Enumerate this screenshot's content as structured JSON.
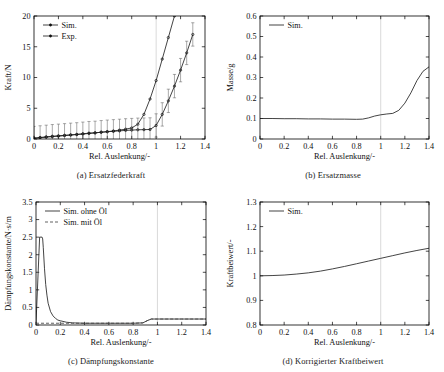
{
  "figure": {
    "panels": [
      "a",
      "b",
      "c",
      "d"
    ]
  },
  "chart_data": [
    {
      "id": "a",
      "type": "line",
      "title": "",
      "caption": "(a) Ersatzfederkraft",
      "xlabel": "Rel. Auslenkung/-",
      "ylabel": "Kraft/N",
      "xlim": [
        0,
        1.4
      ],
      "ylim": [
        0,
        20
      ],
      "xticks": [
        0,
        0.2,
        0.4,
        0.6,
        0.8,
        1,
        1.2,
        1.4
      ],
      "xticklabels": [
        "0",
        "0.2",
        "0.4",
        "0.6",
        "0.8",
        "1",
        "1.2",
        "1.4"
      ],
      "yticks": [
        0,
        5,
        10,
        15,
        20
      ],
      "yticklabels": [
        "0",
        "5",
        "10",
        "15",
        "20"
      ],
      "grid": false,
      "legend_position": "top-left",
      "reference_line_x": 1,
      "series": [
        {
          "name": "Sim.",
          "style": "solid-marker",
          "x": [
            0,
            0.05,
            0.1,
            0.15,
            0.2,
            0.25,
            0.3,
            0.35,
            0.4,
            0.45,
            0.5,
            0.55,
            0.6,
            0.65,
            0.7,
            0.75,
            0.8,
            0.85,
            0.9,
            0.95,
            1.0,
            1.05,
            1.1,
            1.15
          ],
          "y": [
            0.1,
            0.2,
            0.3,
            0.38,
            0.46,
            0.55,
            0.63,
            0.72,
            0.8,
            0.9,
            1.0,
            1.1,
            1.2,
            1.3,
            1.45,
            1.6,
            1.8,
            2.4,
            4.0,
            6.5,
            9.5,
            13.0,
            16.5,
            20.0
          ]
        },
        {
          "name": "Exp.",
          "style": "solid-marker-errorbar",
          "x": [
            0,
            0.05,
            0.1,
            0.15,
            0.2,
            0.25,
            0.3,
            0.35,
            0.4,
            0.45,
            0.5,
            0.55,
            0.6,
            0.65,
            0.7,
            0.75,
            0.8,
            0.85,
            0.9,
            0.95,
            1.0,
            1.05,
            1.1,
            1.15,
            1.2,
            1.25,
            1.3
          ],
          "y": [
            0.15,
            0.25,
            0.35,
            0.45,
            0.52,
            0.6,
            0.68,
            0.75,
            0.85,
            0.95,
            1.0,
            1.1,
            1.18,
            1.25,
            1.32,
            1.4,
            1.45,
            1.5,
            1.52,
            1.55,
            2.2,
            4.0,
            6.2,
            8.6,
            11.2,
            14.0,
            17.0
          ],
          "yerr": [
            1.9,
            1.9,
            1.9,
            1.9,
            1.9,
            1.9,
            1.9,
            1.9,
            1.9,
            1.9,
            1.9,
            1.9,
            1.9,
            1.9,
            1.9,
            1.9,
            1.9,
            1.9,
            1.9,
            1.9,
            1.9,
            1.9,
            1.9,
            1.9,
            1.9,
            1.9,
            1.9
          ]
        }
      ]
    },
    {
      "id": "b",
      "type": "line",
      "title": "",
      "caption": "(b) Ersatzmasse",
      "xlabel": "Rel. Auslenkung/-",
      "ylabel": "Masse/g",
      "xlim": [
        0,
        1.4
      ],
      "ylim": [
        0,
        0.6
      ],
      "xticks": [
        0,
        0.2,
        0.4,
        0.6,
        0.8,
        1,
        1.2,
        1.4
      ],
      "xticklabels": [
        "0",
        "0.2",
        "0.4",
        "0.6",
        "0.8",
        "1",
        "1.2",
        "1.4"
      ],
      "yticks": [
        0,
        0.1,
        0.2,
        0.3,
        0.4,
        0.5,
        0.6
      ],
      "yticklabels": [
        "0",
        "0.1",
        "0.2",
        "0.3",
        "0.4",
        "0.5",
        "0.6"
      ],
      "grid": false,
      "legend_position": "top-left",
      "reference_line_x": 1,
      "series": [
        {
          "name": "Sim.",
          "style": "solid",
          "x": [
            0,
            0.1,
            0.2,
            0.3,
            0.4,
            0.5,
            0.6,
            0.7,
            0.8,
            0.85,
            0.9,
            0.95,
            1.0,
            1.05,
            1.1,
            1.15,
            1.2,
            1.25,
            1.3,
            1.35,
            1.4
          ],
          "y": [
            0.1,
            0.1,
            0.099,
            0.099,
            0.098,
            0.098,
            0.097,
            0.097,
            0.096,
            0.097,
            0.103,
            0.112,
            0.118,
            0.122,
            0.125,
            0.14,
            0.175,
            0.225,
            0.285,
            0.33,
            0.352
          ]
        }
      ]
    },
    {
      "id": "c",
      "type": "line",
      "title": "",
      "caption": "(c) Dämpfungskonstante",
      "xlabel": "Rel. Auslenkung/-",
      "ylabel": "Dämpfungskonstante/N·s/m",
      "xlim": [
        0,
        1.4
      ],
      "ylim": [
        0,
        3.5
      ],
      "xticks": [
        0,
        0.2,
        0.4,
        0.6,
        0.8,
        1,
        1.2,
        1.4
      ],
      "xticklabels": [
        "0",
        "0.2",
        "0.4",
        "0.6",
        "0.8",
        "1",
        "1.2",
        "1.4"
      ],
      "yticks": [
        0,
        0.5,
        1,
        1.5,
        2,
        2.5,
        3,
        3.5
      ],
      "yticklabels": [
        "0",
        "0.5",
        "1",
        "1.5",
        "2",
        "2.5",
        "3",
        "3.5"
      ],
      "grid": false,
      "legend_position": "top-left",
      "reference_line_x": 1,
      "series": [
        {
          "name": "Sim. ohne Öl",
          "style": "solid",
          "x": [
            0,
            0.03,
            0.05,
            0.055,
            0.06,
            0.07,
            0.08,
            0.09,
            0.1,
            0.12,
            0.14,
            0.16,
            0.18,
            0.2,
            0.25,
            0.3,
            0.4,
            0.5,
            0.6,
            0.7,
            0.8,
            0.88,
            0.92,
            0.95,
            1.0,
            1.1,
            1.2,
            1.3,
            1.4
          ],
          "y": [
            0.05,
            2.5,
            2.5,
            2.45,
            2.2,
            1.6,
            1.15,
            0.85,
            0.62,
            0.38,
            0.26,
            0.19,
            0.14,
            0.12,
            0.08,
            0.06,
            0.05,
            0.05,
            0.05,
            0.05,
            0.05,
            0.06,
            0.13,
            0.17,
            0.17,
            0.17,
            0.17,
            0.17,
            0.17
          ]
        },
        {
          "name": "Sim. mit Öl",
          "style": "dashed",
          "x": [
            0,
            0.1,
            0.2,
            0.3,
            0.4,
            0.5,
            0.6,
            0.7,
            0.8,
            0.88,
            0.92,
            0.95,
            1.0,
            1.1,
            1.2,
            1.3,
            1.4
          ],
          "y": [
            0.05,
            0.05,
            0.05,
            0.05,
            0.05,
            0.05,
            0.05,
            0.05,
            0.05,
            0.06,
            0.13,
            0.17,
            0.17,
            0.17,
            0.17,
            0.17,
            0.17
          ]
        }
      ]
    },
    {
      "id": "d",
      "type": "line",
      "title": "",
      "caption": "(d) Korrigierter Kraftbeiwert",
      "xlabel": "Rel. Auslenkung/-",
      "ylabel": "Kraftbeiwert/-",
      "xlim": [
        0,
        1.4
      ],
      "ylim": [
        0.8,
        1.3
      ],
      "xticks": [
        0,
        0.2,
        0.4,
        0.6,
        0.8,
        1,
        1.2,
        1.4
      ],
      "xticklabels": [
        "0",
        "0.2",
        "0.4",
        "0.6",
        "0.8",
        "1",
        "1.2",
        "1.4"
      ],
      "yticks": [
        0.8,
        0.9,
        1.0,
        1.1,
        1.2,
        1.3
      ],
      "yticklabels": [
        "0.8",
        "0.9",
        "1",
        "1.1",
        "1.2",
        "1.3"
      ],
      "grid": false,
      "legend_position": "top-left",
      "reference_line_x": 1,
      "series": [
        {
          "name": "Sim.",
          "style": "solid",
          "x": [
            0,
            0.1,
            0.2,
            0.3,
            0.4,
            0.5,
            0.6,
            0.7,
            0.8,
            0.9,
            1.0,
            1.1,
            1.2,
            1.3,
            1.4
          ],
          "y": [
            1.0,
            1.001,
            1.003,
            1.007,
            1.012,
            1.019,
            1.028,
            1.038,
            1.049,
            1.06,
            1.071,
            1.082,
            1.093,
            1.103,
            1.112
          ]
        }
      ]
    }
  ]
}
